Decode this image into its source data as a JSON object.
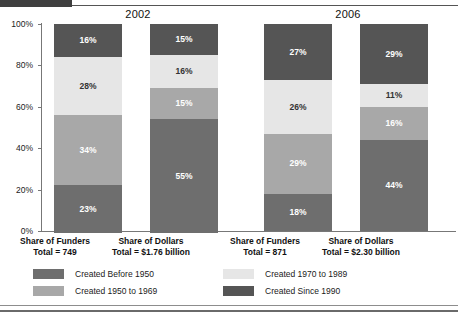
{
  "chart_data": {
    "type": "bar",
    "subtype": "stacked-percent",
    "title": "",
    "xlabel": "",
    "ylabel": "",
    "ylim": [
      0,
      100
    ],
    "grid": false,
    "legend_position": "bottom",
    "ytick_labels": [
      "100%",
      "80%",
      "60%",
      "40%",
      "20%",
      "0%"
    ],
    "ytick_values": [
      100,
      80,
      60,
      40,
      20,
      0
    ],
    "groups": [
      {
        "label": "2002"
      },
      {
        "label": "2006"
      }
    ],
    "categories": [
      "Share of Funders",
      "Share of Dollars",
      "Share of Funders",
      "Share of Dollars"
    ],
    "series": [
      {
        "name": "Created Before 1950",
        "color": "#6e6e6e",
        "values": [
          23,
          55,
          18,
          44
        ]
      },
      {
        "name": "Created 1950 to 1969",
        "color": "#a8a8a8",
        "values": [
          34,
          15,
          29,
          16
        ]
      },
      {
        "name": "Created 1970 to 1989",
        "color": "#e6e6e6",
        "values": [
          28,
          16,
          26,
          11
        ]
      },
      {
        "name": "Created Since 1990",
        "color": "#555555",
        "values": [
          16,
          15,
          27,
          29
        ]
      }
    ],
    "bars": [
      {
        "group": "2002",
        "category": "Share of Funders",
        "total_label": "Total = 749",
        "segments": [
          {
            "series": "Created Since 1990",
            "value": 16,
            "label": "16%",
            "color": "#555555",
            "text_color": "#ffffff"
          },
          {
            "series": "Created 1970 to 1989",
            "value": 28,
            "label": "28%",
            "color": "#e6e6e6",
            "text_color": "#333333"
          },
          {
            "series": "Created 1950 to 1969",
            "value": 34,
            "label": "34%",
            "color": "#a8a8a8",
            "text_color": "#ffffff"
          },
          {
            "series": "Created Before 1950",
            "value": 23,
            "label": "23%",
            "color": "#6e6e6e",
            "text_color": "#ffffff"
          }
        ]
      },
      {
        "group": "2002",
        "category": "Share of Dollars",
        "total_label": "Total = $1.76 billion",
        "segments": [
          {
            "series": "Created Since 1990",
            "value": 15,
            "label": "15%",
            "color": "#555555",
            "text_color": "#ffffff"
          },
          {
            "series": "Created 1970 to 1989",
            "value": 16,
            "label": "16%",
            "color": "#e6e6e6",
            "text_color": "#333333"
          },
          {
            "series": "Created 1950 to 1969",
            "value": 15,
            "label": "15%",
            "color": "#a8a8a8",
            "text_color": "#ffffff"
          },
          {
            "series": "Created Before 1950",
            "value": 55,
            "label": "55%",
            "color": "#6e6e6e",
            "text_color": "#ffffff"
          }
        ]
      },
      {
        "group": "2006",
        "category": "Share of Funders",
        "total_label": "Total = 871",
        "segments": [
          {
            "series": "Created Since 1990",
            "value": 27,
            "label": "27%",
            "color": "#555555",
            "text_color": "#ffffff"
          },
          {
            "series": "Created 1970 to 1989",
            "value": 26,
            "label": "26%",
            "color": "#e6e6e6",
            "text_color": "#333333"
          },
          {
            "series": "Created 1950 to 1969",
            "value": 29,
            "label": "29%",
            "color": "#a8a8a8",
            "text_color": "#ffffff"
          },
          {
            "series": "Created Before 1950",
            "value": 18,
            "label": "18%",
            "color": "#6e6e6e",
            "text_color": "#ffffff"
          }
        ]
      },
      {
        "group": "2006",
        "category": "Share of Dollars",
        "total_label": "Total = $2.30 billion",
        "segments": [
          {
            "series": "Created Since 1990",
            "value": 29,
            "label": "29%",
            "color": "#555555",
            "text_color": "#ffffff"
          },
          {
            "series": "Created 1970 to 1989",
            "value": 11,
            "label": "11%",
            "color": "#e6e6e6",
            "text_color": "#333333"
          },
          {
            "series": "Created 1950 to 1969",
            "value": 16,
            "label": "16%",
            "color": "#a8a8a8",
            "text_color": "#ffffff"
          },
          {
            "series": "Created Before 1950",
            "value": 44,
            "label": "44%",
            "color": "#6e6e6e",
            "text_color": "#ffffff"
          }
        ]
      }
    ],
    "legend": [
      {
        "label": "Created Before 1950",
        "color": "#6e6e6e"
      },
      {
        "label": "Created 1950 to 1969",
        "color": "#a8a8a8"
      },
      {
        "label": "Created 1970 to 1989",
        "color": "#e6e6e6"
      },
      {
        "label": "Created Since 1990",
        "color": "#555555"
      }
    ]
  },
  "axis": {
    "ticks": [
      {
        "label": "100%"
      },
      {
        "label": "80%"
      },
      {
        "label": "60%"
      },
      {
        "label": "40%"
      },
      {
        "label": "20%"
      },
      {
        "label": "0%"
      }
    ]
  },
  "groups": [
    {
      "label": "2002"
    },
    {
      "label": "2006"
    }
  ],
  "categories": [
    {
      "name": "Share of Funders",
      "total": "Total = 749"
    },
    {
      "name": "Share of Dollars",
      "total": "Total = $1.76 billion"
    },
    {
      "name": "Share of Funders",
      "total": "Total = 871"
    },
    {
      "name": "Share of Dollars",
      "total": "Total = $2.30 billion"
    }
  ],
  "legend": [
    {
      "label": "Created Before 1950"
    },
    {
      "label": "Created 1950 to 1969"
    },
    {
      "label": "Created 1970 to 1989"
    },
    {
      "label": "Created Since 1990"
    }
  ]
}
